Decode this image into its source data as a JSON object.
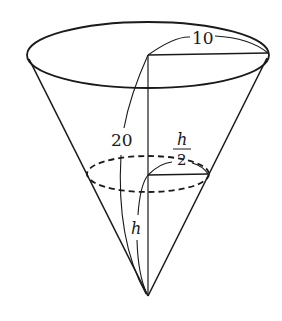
{
  "diagram": {
    "type": "cone-water-level",
    "labels": {
      "radius_top": "10",
      "slant_height": "20",
      "water_radius_num": "h",
      "water_radius_den": "2",
      "water_height": "h"
    },
    "colors": {
      "stroke": "#1a1a1a",
      "background": "#ffffff"
    }
  }
}
